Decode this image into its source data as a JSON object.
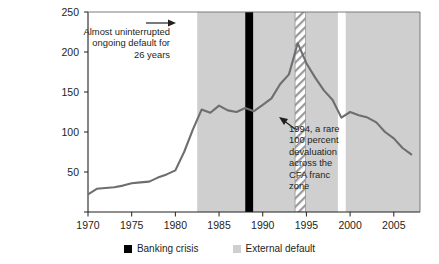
{
  "chart_data": {
    "type": "line",
    "title": "",
    "xlabel": "",
    "ylabel": "",
    "xlim": [
      1970,
      2008
    ],
    "ylim": [
      0,
      250
    ],
    "ytick_values": [
      0,
      50,
      100,
      150,
      200,
      250
    ],
    "ytick_labels": [
      "",
      "50",
      "100",
      "150",
      "200",
      "250"
    ],
    "xtick_values": [
      1970,
      1975,
      1980,
      1985,
      1990,
      1995,
      2000,
      2005
    ],
    "xtick_labels": [
      "1970",
      "1975",
      "1980",
      "1985",
      "1990",
      "1995",
      "2000",
      "2005"
    ],
    "grid": false,
    "legend_position": "bottom-center",
    "series": [
      {
        "name": "debt-ratio-line",
        "color": "#6d6e71",
        "x": [
          1970,
          1971,
          1972,
          1973,
          1974,
          1975,
          1976,
          1977,
          1978,
          1979,
          1980,
          1981,
          1982,
          1983,
          1984,
          1985,
          1986,
          1987,
          1988,
          1989,
          1990,
          1991,
          1992,
          1993,
          1994,
          1995,
          1996,
          1997,
          1998,
          1999,
          2000,
          2001,
          2002,
          2003,
          2004,
          2005,
          2006,
          2007
        ],
        "values": [
          22,
          29,
          30,
          31,
          33,
          36,
          37,
          38,
          43,
          47,
          52,
          75,
          103,
          128,
          124,
          133,
          127,
          125,
          130,
          126,
          134,
          142,
          160,
          172,
          211,
          186,
          168,
          152,
          140,
          118,
          125,
          121,
          118,
          112,
          100,
          92,
          80,
          72
        ]
      }
    ],
    "bands": [
      {
        "name": "external-default-band",
        "kind": "external-default",
        "color": "#cfcfcf",
        "start": 1982.5,
        "end": 2008,
        "gaps": [
          [
            1993.7,
            1994.9
          ],
          [
            1998.6,
            1999.5
          ]
        ]
      },
      {
        "name": "banking-crisis-band",
        "kind": "banking-crisis",
        "color": "#000000",
        "start": 1988.0,
        "end": 1988.9
      },
      {
        "name": "cfa-franc-hatch-band",
        "kind": "hatched-highlight",
        "color": "#ffffff",
        "start": 1993.7,
        "end": 1994.9
      }
    ],
    "annotations": [
      {
        "name": "ongoing-default-note",
        "text": "Almost uninterrupted ongoing default for 26 years",
        "lines": [
          "Almost uninterrupted",
          "ongoing default for",
          "26 years"
        ],
        "arrow": "right"
      },
      {
        "name": "cfa-devaluation-note",
        "text": "1994, a rare 100 percent devaluation across the CFA franc zone",
        "lines": [
          "1994, a rare",
          "100 percent",
          "devaluation",
          "across the",
          "CFA franc",
          "zone"
        ],
        "arrow": "up-left"
      }
    ],
    "legend": [
      {
        "label": "Banking crisis",
        "color": "#000000",
        "icon": "square-swatch"
      },
      {
        "label": "External default",
        "color": "#cfcfcf",
        "icon": "square-swatch"
      }
    ]
  }
}
